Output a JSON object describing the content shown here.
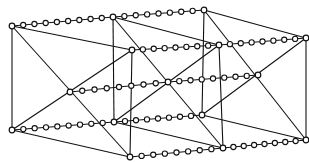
{
  "diagram": {
    "colors": {
      "line": "#111111",
      "background": "#ffffff",
      "bead_fill": "#ffffff"
    },
    "nodes": {
      "A": [
        12,
        26
      ],
      "B": [
        113,
        17
      ],
      "C": [
        204,
        10
      ],
      "D": [
        132,
        50
      ],
      "E": [
        219,
        45
      ],
      "F": [
        306,
        38
      ],
      "G": [
        70,
        92
      ],
      "H": [
        168,
        82
      ],
      "I": [
        258,
        75
      ],
      "J": [
        12,
        130
      ],
      "K": [
        114,
        122
      ],
      "L": [
        202,
        115
      ],
      "M": [
        130,
        157
      ],
      "N": [
        223,
        148
      ],
      "O": [
        306,
        140
      ]
    },
    "edges": [
      [
        "A",
        "J"
      ],
      [
        "A",
        "D"
      ],
      [
        "A",
        "M"
      ],
      [
        "J",
        "D"
      ],
      [
        "J",
        "M"
      ],
      [
        "D",
        "M"
      ],
      [
        "B",
        "K"
      ],
      [
        "B",
        "E"
      ],
      [
        "B",
        "N"
      ],
      [
        "K",
        "E"
      ],
      [
        "K",
        "N"
      ],
      [
        "E",
        "N"
      ],
      [
        "C",
        "L"
      ],
      [
        "C",
        "F"
      ],
      [
        "C",
        "O"
      ],
      [
        "L",
        "F"
      ],
      [
        "L",
        "O"
      ],
      [
        "F",
        "O"
      ]
    ],
    "chains": [
      {
        "from": "A",
        "to": "B",
        "beads": 8
      },
      {
        "from": "B",
        "to": "C",
        "beads": 7
      },
      {
        "from": "D",
        "to": "E",
        "beads": 7
      },
      {
        "from": "E",
        "to": "F",
        "beads": 7
      },
      {
        "from": "G",
        "to": "H",
        "beads": 7
      },
      {
        "from": "H",
        "to": "I",
        "beads": 7
      },
      {
        "from": "J",
        "to": "K",
        "beads": 8
      },
      {
        "from": "K",
        "to": "L",
        "beads": 7
      },
      {
        "from": "M",
        "to": "N",
        "beads": 7
      },
      {
        "from": "N",
        "to": "O",
        "beads": 7
      }
    ],
    "bead_radius": 2.6,
    "node_radius": 2.8
  }
}
